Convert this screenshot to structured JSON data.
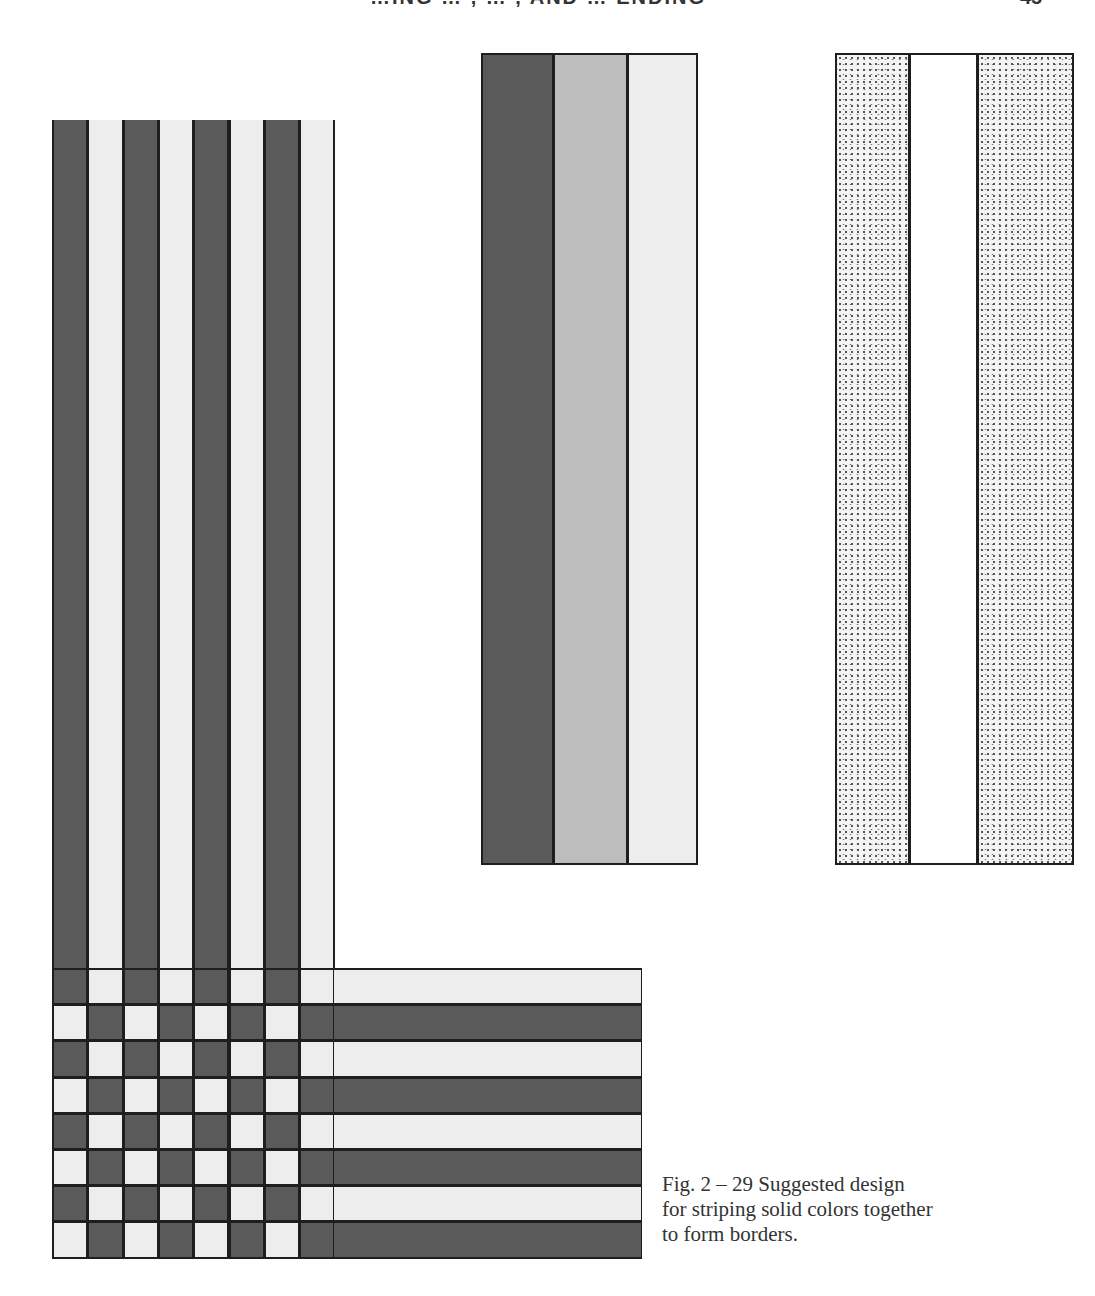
{
  "page": {
    "header_partial": "…ING … , … , AND … ENDING",
    "page_number": "45"
  },
  "figure": {
    "caption": "Fig. 2 – 29 Suggested design for striping solid colors together to form borders.",
    "caption_lines": [
      "Fig. 2 – 29 Suggested design",
      "for striping solid colors together",
      "to form borders."
    ]
  },
  "colors": {
    "dark": "#5a5a5a",
    "medium": "#bdbdbd",
    "light": "#ededed",
    "line": "#1e1e1e"
  },
  "woven_border": {
    "vertical_stripes": [
      "dark",
      "light",
      "dark",
      "light",
      "dark",
      "light",
      "dark",
      "light"
    ],
    "horizontal_stripes": [
      "light",
      "dark",
      "light",
      "dark",
      "light",
      "dark",
      "light",
      "dark"
    ],
    "pattern": "checkerboard at intersection"
  },
  "panel_gradient": {
    "columns": [
      "dark",
      "medium",
      "light"
    ]
  },
  "panel_textured": {
    "columns": [
      "speckled",
      "white",
      "speckled"
    ]
  }
}
